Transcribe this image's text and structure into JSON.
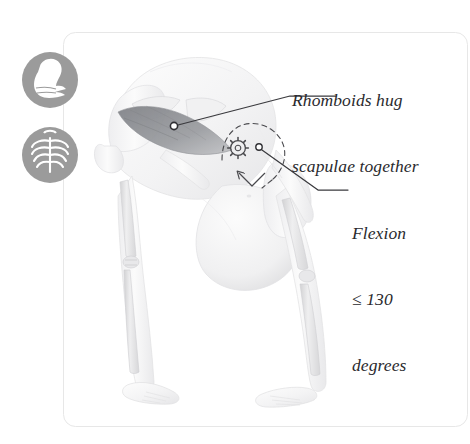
{
  "figure": {
    "title_alt": "Standing forward bend with rhomboid engagement",
    "card": {
      "border_color": "#e7e7e7",
      "background": "#ffffff",
      "corner_radius": 12
    }
  },
  "icons": [
    {
      "name": "flexed-biceps-icon",
      "label": "Muscle",
      "circle_color": "#9b9b9b",
      "glyph_color": "#ffffff",
      "cx": 50,
      "cy": 80,
      "r": 28
    },
    {
      "name": "ribcage-icon",
      "label": "Skeleton",
      "circle_color": "#9b9b9b",
      "glyph_color": "#ffffff",
      "cx": 50,
      "cy": 155,
      "r": 28
    }
  ],
  "annotations": [
    {
      "id": "rhomboids",
      "lines": [
        "Rhomboids hug",
        "scapulae together"
      ],
      "anchor": {
        "x": 174,
        "y": 126
      },
      "leader": "M174,126 L290,96 L336,96",
      "marker": "open-circle",
      "color": "#3a3a3e"
    },
    {
      "id": "flexion",
      "lines": [
        "Flexion",
        "≤ 130",
        "degrees"
      ],
      "anchor": {
        "x": 259,
        "y": 147
      },
      "leader": "M259,147 L318,190 L348,190",
      "marker": "open-circle",
      "color": "#3a3a3e"
    }
  ],
  "overlays": [
    {
      "name": "flexion-arc",
      "type": "dashed-arc",
      "color": "#4a4a4e",
      "note": "hip flexion angle arc with arrowhead"
    },
    {
      "name": "gear-icon",
      "type": "cog",
      "cx": 238,
      "cy": 148,
      "r": 9,
      "color": "#4a4a4e"
    },
    {
      "name": "rhomboid-muscle-shading",
      "type": "shaded-region",
      "color": "#8d8f93"
    }
  ],
  "colors": {
    "ink": "#2a2a2e",
    "leader": "#3a3a3e",
    "icon_gray": "#9b9b9b",
    "muscle_dark": "#8d8f93",
    "body_light": "#f2f2f3",
    "bone": "#dcdcdd",
    "card_border": "#e7e7e7"
  }
}
